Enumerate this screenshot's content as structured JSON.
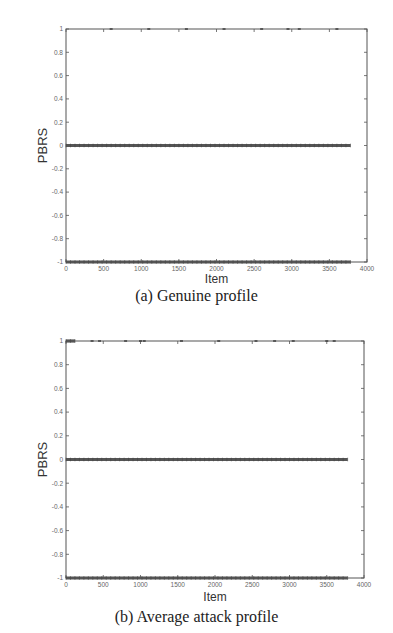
{
  "chart_data": [
    {
      "type": "scatter",
      "panel": "a",
      "caption": "(a) Genuine profile",
      "title": "",
      "xlabel": "Item",
      "ylabel": "PBRS",
      "xlim": [
        0,
        4000
      ],
      "ylim": [
        -1,
        1
      ],
      "xticks": [
        0,
        500,
        1000,
        1500,
        2000,
        2500,
        3000,
        3500,
        4000
      ],
      "yticks": [
        1,
        0.8,
        0.6,
        0.4,
        0.2,
        0,
        -0.2,
        -0.4,
        -0.6,
        -0.8,
        -1
      ],
      "ytick_labels": [
        "1",
        "0.8",
        "0.6",
        "0.4",
        "0.2",
        "0",
        "-0.2",
        "-0.4",
        "-0.6",
        "-0.8",
        "-1"
      ],
      "grid": false,
      "series": [
        {
          "name": "PBRS = 0",
          "x_range": [
            0,
            3780
          ],
          "y": 0,
          "density": "dense"
        },
        {
          "name": "PBRS = -1",
          "x_range": [
            0,
            3780
          ],
          "y": -1,
          "density": "dense"
        },
        {
          "name": "PBRS = 1",
          "x": [
            600,
            1100,
            1600,
            2100,
            2600,
            2950,
            3100,
            3600
          ],
          "y": 1,
          "density": "sparse"
        }
      ]
    },
    {
      "type": "scatter",
      "panel": "b",
      "caption": "(b) Average attack profile",
      "title": "",
      "xlabel": "Item",
      "ylabel": "PBRS",
      "xlim": [
        0,
        4000
      ],
      "ylim": [
        -1,
        1
      ],
      "xticks": [
        0,
        500,
        1000,
        1500,
        2000,
        2500,
        3000,
        3500,
        4000
      ],
      "yticks": [
        1,
        0.8,
        0.6,
        0.4,
        0.2,
        0,
        -0.2,
        -0.4,
        -0.6,
        -0.8,
        -1
      ],
      "ytick_labels": [
        "1",
        "0.8",
        "0.6",
        "0.4",
        "0.2",
        "0",
        "-0.2",
        "-0.4",
        "-0.6",
        "-0.8",
        "-1"
      ],
      "grid": false,
      "series": [
        {
          "name": "PBRS = 0",
          "x_range": [
            0,
            3780
          ],
          "y": 0,
          "density": "dense"
        },
        {
          "name": "PBRS = -1",
          "x_range": [
            0,
            3780
          ],
          "y": -1,
          "density": "dense"
        },
        {
          "name": "PBRS = 1 (filler cluster)",
          "x_range": [
            0,
            120
          ],
          "y": 1,
          "density": "dense"
        },
        {
          "name": "PBRS = 1",
          "x": [
            350,
            450,
            800,
            1000,
            1050,
            1550,
            2050,
            2550,
            2800,
            3050,
            3500,
            3600
          ],
          "y": 1,
          "density": "sparse"
        }
      ]
    }
  ],
  "figure_a": {
    "caption": "(a) Genuine profile",
    "xlabel": "Item",
    "ylabel": "PBRS"
  },
  "figure_b": {
    "caption": "(b) Average attack profile",
    "xlabel": "Item",
    "ylabel": "PBRS"
  },
  "colors": {
    "axis": "#555555",
    "data": "#555555",
    "tick_text": "#666666"
  }
}
